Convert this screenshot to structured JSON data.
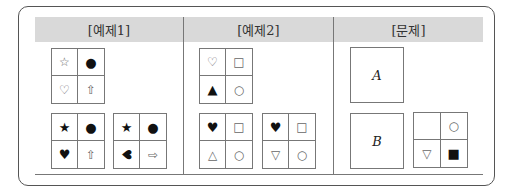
{
  "sections": [
    {
      "label": "[예제1]"
    },
    {
      "label": "[예제2]"
    },
    {
      "label": "[문제]"
    }
  ],
  "example1": {
    "grid_top": [
      {
        "symbol": "☆",
        "name": "white-star-icon",
        "light": true
      },
      {
        "symbol": "●",
        "name": "black-circle-icon",
        "light": false
      },
      {
        "symbol": "♡",
        "name": "white-heart-icon",
        "light": true
      },
      {
        "symbol": "⇧",
        "name": "white-up-arrow-icon",
        "light": true
      }
    ],
    "grid_bottom_left": [
      {
        "symbol": "★",
        "name": "black-star-icon",
        "light": false
      },
      {
        "symbol": "●",
        "name": "black-circle-icon",
        "light": false
      },
      {
        "symbol": "♥",
        "name": "black-heart-icon",
        "light": false
      },
      {
        "symbol": "⇧",
        "name": "white-up-arrow-icon",
        "light": true
      }
    ],
    "grid_bottom_right": [
      {
        "symbol": "★",
        "name": "black-star-icon",
        "light": false
      },
      {
        "symbol": "●",
        "name": "black-circle-icon",
        "light": false
      },
      {
        "symbol": "♥",
        "name": "black-heart-rotated-left-icon",
        "light": false,
        "rotated": true
      },
      {
        "symbol": "⇨",
        "name": "white-right-arrow-icon",
        "light": true
      }
    ]
  },
  "example2": {
    "grid_top": [
      {
        "symbol": "♡",
        "name": "white-heart-icon",
        "light": true
      },
      {
        "symbol": "□",
        "name": "white-square-icon",
        "light": true
      },
      {
        "symbol": "▲",
        "name": "black-triangle-up-icon",
        "light": false
      },
      {
        "symbol": "○",
        "name": "white-circle-icon",
        "light": true
      }
    ],
    "grid_bottom_left": [
      {
        "symbol": "♥",
        "name": "black-heart-icon",
        "light": false
      },
      {
        "symbol": "□",
        "name": "white-square-icon",
        "light": true
      },
      {
        "symbol": "△",
        "name": "white-triangle-up-icon",
        "light": true
      },
      {
        "symbol": "○",
        "name": "white-circle-icon",
        "light": true
      }
    ],
    "grid_bottom_right": [
      {
        "symbol": "♥",
        "name": "black-heart-icon",
        "light": false
      },
      {
        "symbol": "□",
        "name": "white-square-icon",
        "light": true
      },
      {
        "symbol": "▽",
        "name": "white-triangle-down-icon",
        "light": true
      },
      {
        "symbol": "○",
        "name": "white-circle-icon",
        "light": true
      }
    ]
  },
  "problem": {
    "box_a": "A",
    "box_b": "B",
    "grid": [
      {
        "symbol": "",
        "name": "empty-cell",
        "light": true
      },
      {
        "symbol": "○",
        "name": "white-circle-icon",
        "light": true
      },
      {
        "symbol": "▽",
        "name": "white-triangle-down-icon",
        "light": true
      },
      {
        "symbol": "■",
        "name": "black-square-icon",
        "light": false
      }
    ]
  },
  "colors": {
    "header_bg": "#d9d9d9",
    "border": "#777777"
  }
}
